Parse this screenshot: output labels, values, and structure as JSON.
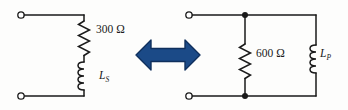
{
  "figure": {
    "background_color": "#fdfdfc",
    "wire_color": "#1a1a1a",
    "arrow_color": "#1b4a87",
    "arrow_outline_color": "#0f2f5c"
  },
  "left_circuit": {
    "name": "series-rl-circuit",
    "topology": "series",
    "resistor": {
      "label": "300 Ω",
      "value": "300",
      "unit": "Ω",
      "symbol": "zigzag-resistor"
    },
    "inductor": {
      "label": "LS",
      "symbol_letter": "L",
      "subscript": "S",
      "symbol": "coil-inductor"
    },
    "terminals": {
      "top": "open-terminal",
      "bottom": "open-terminal"
    }
  },
  "equivalence_arrow": {
    "name": "double-headed-arrow",
    "direction": "left-right",
    "meaning": "equivalent-to"
  },
  "right_circuit": {
    "name": "parallel-rl-circuit",
    "topology": "parallel",
    "resistor": {
      "label": "600 Ω",
      "value": "600",
      "unit": "Ω",
      "symbol": "zigzag-resistor"
    },
    "inductor": {
      "label": "LP",
      "symbol_letter": "L",
      "subscript": "P",
      "symbol": "coil-inductor"
    },
    "terminals": {
      "top": "open-terminal",
      "bottom": "open-terminal"
    },
    "nodes": {
      "top_junction": "filled-node-dot",
      "bottom_junction": "filled-node-dot"
    }
  }
}
